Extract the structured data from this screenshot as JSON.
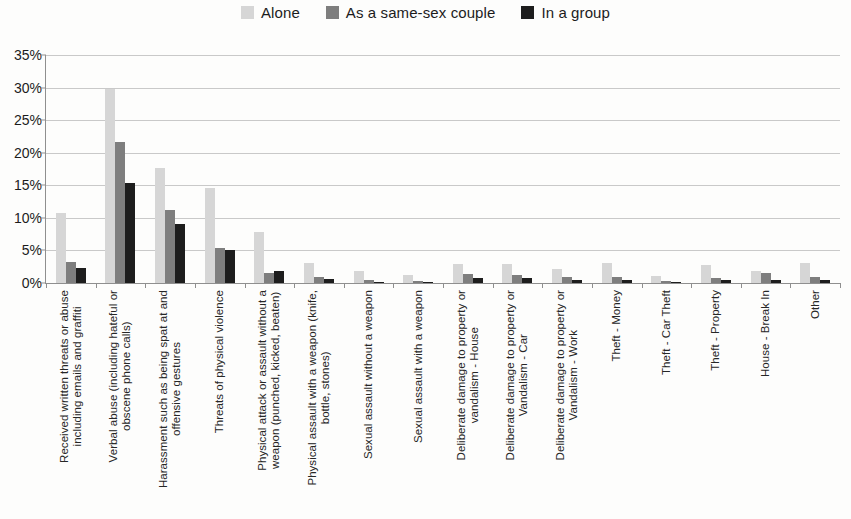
{
  "legend": {
    "position": "top-center",
    "entries": [
      {
        "label": "Alone",
        "color": "#d6d6d6"
      },
      {
        "label": "As a same-sex couple",
        "color": "#7e7e7e"
      },
      {
        "label": "In a group",
        "color": "#1d1d1d"
      }
    ]
  },
  "axis": {
    "y_ticks": [
      "0%",
      "5%",
      "10%",
      "15%",
      "20%",
      "25%",
      "30%",
      "35%"
    ]
  },
  "chart_data": {
    "type": "bar",
    "title": "",
    "subtitle": "",
    "xlabel": "",
    "ylabel": "",
    "ylim": [
      0,
      35
    ],
    "ytick_values": [
      0,
      5,
      10,
      15,
      20,
      25,
      30,
      35
    ],
    "ytick_labels": [
      "0%",
      "5%",
      "10%",
      "15%",
      "20%",
      "25%",
      "30%",
      "35%"
    ],
    "grid": true,
    "legend_position": "top-center",
    "value_unit": "percent",
    "categories": [
      "Received written threats or abuse including emails and graffiti",
      "Verbal abuse (including hateful or obscene phone calls)",
      "Harassment such as being spat at and offensive gestures",
      "Threats of physical violence",
      "Physical attack or assault without a weapon (punched, kicked, beaten)",
      "Physical assault with a weapon (knife, bottle, stones)",
      "Sexual assault without a weapon",
      "Sexual assault with a weapon",
      "Deliberate damage to property or vandalism - House",
      "Deliberate damage to property or Vandalism - Car",
      "Deliberate damage to property or Vandalism - Work",
      "Theft - Money",
      "Theft - Car Theft",
      "Theft - Property",
      "House - Break In",
      "Other"
    ],
    "category_lines": [
      [
        "Received written threats or abuse",
        "including emails and graffiti"
      ],
      [
        "Verbal abuse (including hateful or",
        "obscene phone calls)"
      ],
      [
        "Harassment such as being spat at and",
        "offensive gestures"
      ],
      [
        "Threats of physical violence",
        ""
      ],
      [
        "Physical attack or assault without a",
        "weapon (punched, kicked, beaten)"
      ],
      [
        "Physical assault with a weapon (knife,",
        "bottle, stones)"
      ],
      [
        "Sexual assault without a weapon",
        ""
      ],
      [
        "Sexual assault with a weapon",
        ""
      ],
      [
        "Deliberate damage to property or",
        "vandalism - House"
      ],
      [
        "Deliberate damage to property or",
        "Vandalism - Car"
      ],
      [
        "Deliberate damage to property or",
        "Vandalism - Work"
      ],
      [
        "Theft - Money",
        ""
      ],
      [
        "Theft - Car Theft",
        ""
      ],
      [
        "Theft - Property",
        ""
      ],
      [
        "House - Break In",
        ""
      ],
      [
        "Other",
        ""
      ]
    ],
    "series": [
      {
        "name": "Alone",
        "color": "#d6d6d6",
        "values": [
          10.8,
          29.8,
          17.6,
          14.6,
          7.8,
          3.0,
          1.8,
          1.2,
          2.9,
          2.9,
          2.2,
          3.0,
          1.1,
          2.8,
          1.8,
          3.0
        ]
      },
      {
        "name": "As a same-sex couple",
        "color": "#7e7e7e",
        "values": [
          3.2,
          21.7,
          11.2,
          5.3,
          1.6,
          0.9,
          0.4,
          0.3,
          1.4,
          1.3,
          1.0,
          0.9,
          0.3,
          0.7,
          1.6,
          0.9
        ]
      },
      {
        "name": "In a group",
        "color": "#1d1d1d",
        "values": [
          2.3,
          15.4,
          9.0,
          5.0,
          1.9,
          0.6,
          0.2,
          0.15,
          0.8,
          0.7,
          0.5,
          0.4,
          0.2,
          0.4,
          0.5,
          0.5
        ]
      }
    ]
  }
}
